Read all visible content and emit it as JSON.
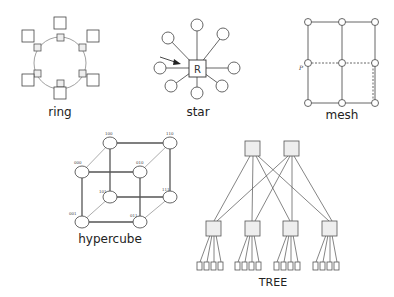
{
  "figure": {
    "diagrams": [
      {
        "id": "ring",
        "label": "ring"
      },
      {
        "id": "star",
        "label": "star",
        "center_node": "R"
      },
      {
        "id": "mesh",
        "label": "mesh",
        "annotation": "P"
      },
      {
        "id": "hypercube",
        "label": "hypercube",
        "nodes": [
          "100",
          "110",
          "000",
          "010",
          "101",
          "111",
          "001",
          "011"
        ]
      },
      {
        "id": "tree",
        "label": "TREE"
      }
    ]
  },
  "colors": {
    "stroke": "#555555",
    "node_fill": "#ffffff",
    "box_fill": "#eeeeee",
    "text": "#222222"
  }
}
